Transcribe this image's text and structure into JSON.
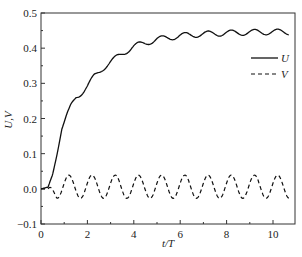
{
  "chart_data": {
    "type": "line",
    "title": "",
    "xlabel": "t/T",
    "ylabel": "U,V",
    "xlim": [
      0,
      11
    ],
    "ylim": [
      -0.1,
      0.5
    ],
    "xticks": [
      0,
      2,
      4,
      6,
      8,
      10
    ],
    "xtick_labels": [
      "0",
      "2",
      "4",
      "6",
      "8",
      "10"
    ],
    "yticks": [
      -0.1,
      0.0,
      0.1,
      0.2,
      0.3,
      0.4,
      0.5
    ],
    "ytick_labels": [
      "−0.1",
      "0.0",
      "0.1",
      "0.2",
      "0.3",
      "0.4",
      "0.5"
    ],
    "grid": false,
    "legend_position": "upper right",
    "legend": [
      {
        "label": "U",
        "style": "solid"
      },
      {
        "label": "V",
        "style": "dashed"
      }
    ],
    "series": [
      {
        "name": "U",
        "style": "solid",
        "color": "#111111",
        "x": [
          0.0,
          0.3,
          0.5,
          0.7,
          0.9,
          1.1,
          1.3,
          1.5,
          1.7,
          2.0,
          2.3,
          2.6,
          3.0,
          3.5,
          4.0,
          4.5,
          5.0,
          5.5,
          6.0,
          6.5,
          7.0,
          7.5,
          8.0,
          8.5,
          9.0,
          9.5,
          10.0,
          10.7
        ],
        "values": [
          0.0,
          0.005,
          0.04,
          0.1,
          0.17,
          0.21,
          0.24,
          0.26,
          0.27,
          0.29,
          0.32,
          0.34,
          0.36,
          0.385,
          0.405,
          0.415,
          0.425,
          0.43,
          0.435,
          0.438,
          0.44,
          0.442,
          0.443,
          0.444,
          0.445,
          0.446,
          0.446,
          0.446
        ],
        "oscillation_amplitude": 0.008,
        "oscillation_period": 1.0
      },
      {
        "name": "V",
        "style": "dashed",
        "color": "#111111",
        "x_start": 0.3,
        "x_end": 10.7,
        "mean": 0.006,
        "amplitude": 0.033,
        "period": 1.0,
        "first_peak_x": 1.2,
        "peak_value": 0.04,
        "trough_value": -0.027
      }
    ]
  }
}
